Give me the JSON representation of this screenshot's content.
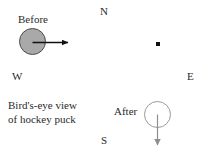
{
  "figure": {
    "title": "Bird's-eye view of hockey puck",
    "width": 206,
    "height": 161,
    "background_color": "#ffffff"
  },
  "compass": {
    "north": "N",
    "west": "W",
    "east": "E",
    "south": "S"
  },
  "states": {
    "before": {
      "label": "Before",
      "puck_fill_color": "#a9a9a9",
      "puck_stroke_color": "#4a4a4a",
      "velocity_direction": "east",
      "arrow_color": "#111111"
    },
    "after": {
      "label": "After",
      "puck_fill_color": "#ffffff",
      "puck_stroke_color": "#9a9a9a",
      "velocity_direction": "south",
      "arrow_color": "#8e8e8e"
    }
  },
  "caption": {
    "line1": "Bird's-eye view",
    "line2": "of hockey puck"
  },
  "center_marker": {
    "name": "reference-point",
    "color": "#111111"
  }
}
